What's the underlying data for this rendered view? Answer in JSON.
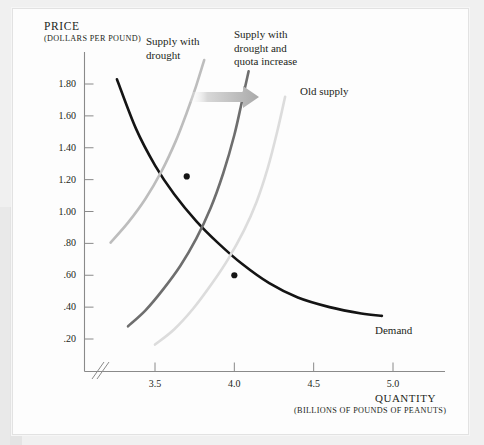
{
  "figure": {
    "background_color": "#f0f0f0",
    "card_color": "#fdfdfd"
  },
  "chart_data": {
    "type": "line",
    "title": "",
    "xlabel": "QUANTITY",
    "xlabel_sub": "(BILLIONS OF POUNDS OF PEANUTS)",
    "ylabel": "PRICE",
    "ylabel_sub": "(DOLLARS PER POUND)",
    "xlim": [
      3.1,
      5.2
    ],
    "ylim": [
      0.0,
      1.95
    ],
    "xticks": [
      "3.5",
      "4.0",
      "4.5",
      "5.0"
    ],
    "xtick_values": [
      3.5,
      4.0,
      4.5,
      5.0
    ],
    "yticks": [
      ".20",
      ".40",
      ".60",
      ".80",
      "1.00",
      "1.20",
      "1.40",
      "1.60",
      "1.80"
    ],
    "ytick_values": [
      0.2,
      0.4,
      0.6,
      0.8,
      1.0,
      1.2,
      1.4,
      1.6,
      1.8
    ],
    "grid": false,
    "axis_break": true,
    "legend_position": "inline-annotations",
    "series": [
      {
        "name": "Demand",
        "label": "Demand",
        "color": "#141414",
        "width": 2.6,
        "points": [
          [
            3.26,
            1.83
          ],
          [
            3.38,
            1.52
          ],
          [
            3.5,
            1.29
          ],
          [
            3.62,
            1.11
          ],
          [
            3.76,
            0.94
          ],
          [
            3.9,
            0.8
          ],
          [
            4.05,
            0.67
          ],
          [
            4.22,
            0.55
          ],
          [
            4.4,
            0.46
          ],
          [
            4.6,
            0.4
          ],
          [
            4.8,
            0.36
          ],
          [
            4.93,
            0.345
          ]
        ]
      },
      {
        "name": "Old supply",
        "label": "Old supply",
        "color": "#dcdcdc",
        "width": 2.6,
        "points": [
          [
            3.5,
            0.165
          ],
          [
            3.62,
            0.26
          ],
          [
            3.74,
            0.39
          ],
          [
            3.86,
            0.55
          ],
          [
            3.96,
            0.7
          ],
          [
            4.06,
            0.88
          ],
          [
            4.14,
            1.06
          ],
          [
            4.21,
            1.27
          ],
          [
            4.27,
            1.5
          ],
          [
            4.32,
            1.72
          ]
        ]
      },
      {
        "name": "Supply with drought and quota increase",
        "label": "Supply with drought and quota increase",
        "color": "#6e6e6e",
        "width": 2.6,
        "points": [
          [
            3.33,
            0.28
          ],
          [
            3.44,
            0.38
          ],
          [
            3.55,
            0.51
          ],
          [
            3.66,
            0.66
          ],
          [
            3.76,
            0.83
          ],
          [
            3.85,
            1.02
          ],
          [
            3.93,
            1.24
          ],
          [
            4.0,
            1.48
          ],
          [
            4.05,
            1.7
          ],
          [
            4.09,
            1.88
          ]
        ]
      },
      {
        "name": "Supply with drought",
        "label": "Supply with drought",
        "color": "#bdbdbd",
        "width": 2.6,
        "points": [
          [
            3.22,
            0.805
          ],
          [
            3.33,
            0.93
          ],
          [
            3.44,
            1.08
          ],
          [
            3.54,
            1.25
          ],
          [
            3.63,
            1.44
          ],
          [
            3.7,
            1.62
          ],
          [
            3.76,
            1.79
          ],
          [
            3.81,
            1.95
          ]
        ]
      }
    ],
    "markers": [
      {
        "name": "equilibrium-drought-quota",
        "x": 3.7,
        "y": 1.22,
        "color": "#141414"
      },
      {
        "name": "equilibrium-old-supply",
        "x": 4.0,
        "y": 0.6,
        "color": "#141414"
      }
    ],
    "annotations": [
      {
        "name": "shift-arrow",
        "type": "arrow",
        "from_x": 3.62,
        "to_x": 4.22,
        "y": 1.62,
        "color": "#b4b4b4"
      }
    ]
  },
  "labels": {
    "price_title": "PRICE",
    "price_sub": "(DOLLARS PER POUND)",
    "quantity_title": "QUANTITY",
    "quantity_sub": "(BILLIONS OF POUNDS OF PEANUTS)",
    "supply_with_drought_line1": "Supply with",
    "supply_with_drought_line2": "drought",
    "supply_quota_line1": "Supply with",
    "supply_quota_line2": "drought and",
    "supply_quota_line3": "quota increase",
    "old_supply": "Old supply",
    "demand": "Demand"
  },
  "ytick_labels": [
    "1.80",
    "1.60",
    "1.40",
    "1.20",
    "1.00",
    ".80",
    ".60",
    ".40",
    ".20"
  ],
  "xtick_labels": [
    "3.5",
    "4.0",
    "4.5",
    "5.0"
  ]
}
